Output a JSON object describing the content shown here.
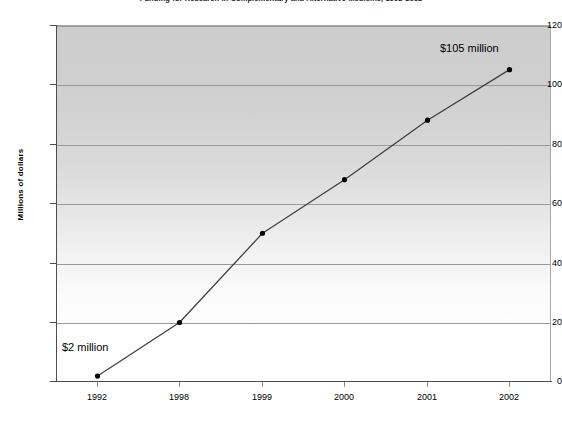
{
  "chart_data": {
    "type": "line",
    "title": "Funding for Research in Complementary and Alternative Medicine, 1992-2002",
    "xlabel": "",
    "ylabel": "Millions of dollars",
    "categories": [
      "1992",
      "1998",
      "1999",
      "2000",
      "2001",
      "2002"
    ],
    "values": [
      2,
      20,
      50,
      68,
      88,
      105
    ],
    "series": [
      {
        "name": "Funding",
        "values": [
          2,
          20,
          50,
          68,
          88,
          105
        ]
      }
    ],
    "ylim": [
      0,
      120
    ],
    "ytick_labels": [
      "0",
      "20",
      "40",
      "60",
      "80",
      "100",
      "120"
    ],
    "yticks": [
      0,
      20,
      40,
      60,
      80,
      100,
      120
    ],
    "grid": true,
    "legend": false,
    "legend_position": "none",
    "marker": "filled-circle",
    "line_color": "#404040",
    "marker_color": "#000000",
    "gridline_color": "#9a9a9a",
    "plot_bg_top": "#cdcdcd",
    "plot_bg_bottom": "#ffffff",
    "annotations": [
      {
        "name": "start-value",
        "text": "$2 million",
        "point_index": 0,
        "value": 2
      },
      {
        "name": "end-value",
        "text": "$105 million",
        "point_index": 5,
        "value": 105
      }
    ]
  }
}
